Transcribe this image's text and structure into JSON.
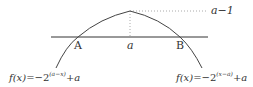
{
  "diagram": {
    "points": {
      "A": "A",
      "B": "B",
      "a": "a"
    },
    "peak_label": "a−1",
    "left_function": {
      "lhs": "f(x)",
      "eq": "=−2",
      "exponent": "(a−x)",
      "tail": "+a"
    },
    "right_function": {
      "lhs": "f(x)",
      "eq": "=−2",
      "exponent": "(x−a)",
      "tail": "+a"
    },
    "colors": {
      "curve": "#444444",
      "axis": "#333333",
      "dotted": "#999999"
    }
  }
}
